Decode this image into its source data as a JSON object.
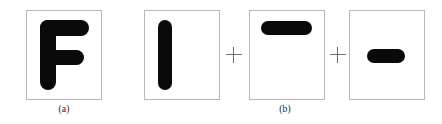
{
  "figure": {
    "background_color": "#ffffff",
    "ink_color": "#0a0a0a",
    "panel_border_color": "#b8b8b8",
    "operator_color": "#6f6f6f",
    "width": 442,
    "height": 124
  },
  "subfigures": [
    {
      "id": "a",
      "caption": "(a)",
      "description": "original binary image of letter F",
      "panels": [
        {
          "name": "panel-letter-f",
          "shape": "letter-F",
          "strokes": [
            {
              "name": "f-vertical-stem",
              "orientation": "vertical"
            },
            {
              "name": "f-top-arm",
              "orientation": "horizontal"
            },
            {
              "name": "f-middle-arm",
              "orientation": "horizontal"
            }
          ]
        }
      ],
      "operators": []
    },
    {
      "id": "b",
      "caption": "(b)",
      "description": "decomposition of F into structuring-element components",
      "panels": [
        {
          "name": "panel-vertical-bar",
          "shape": "vertical-bar",
          "strokes": [
            {
              "name": "vertical-bar",
              "orientation": "vertical"
            }
          ]
        },
        {
          "name": "panel-top-horizontal-bar",
          "shape": "horizontal-bar-top",
          "strokes": [
            {
              "name": "top-horizontal-bar",
              "orientation": "horizontal"
            }
          ]
        },
        {
          "name": "panel-middle-horizontal-bar",
          "shape": "horizontal-bar-middle",
          "strokes": [
            {
              "name": "middle-horizontal-bar",
              "orientation": "horizontal"
            }
          ]
        }
      ],
      "operators": [
        {
          "name": "plus-operator-1",
          "symbol": "+"
        },
        {
          "name": "plus-operator-2",
          "symbol": "+"
        }
      ]
    }
  ]
}
